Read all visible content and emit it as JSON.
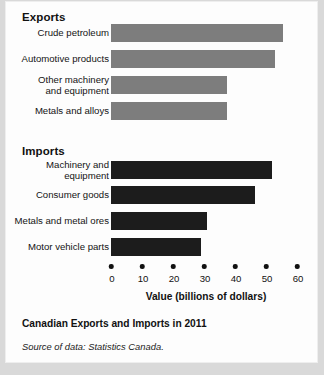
{
  "figure": {
    "caption_title": "Canadian Exports and Imports in 2011",
    "source_note": "Source of data: Statistics Canada."
  },
  "sections": {
    "exports_heading": "Exports",
    "imports_heading": "Imports"
  },
  "colors": {
    "export_bar": "#7d7d7d",
    "import_bar": "#1c1c1c",
    "background": "#fdfdfd",
    "text": "#111111"
  },
  "chart_data": {
    "type": "bar",
    "orientation": "horizontal",
    "title": "Canadian Exports and Imports in 2011",
    "subtitle": "",
    "xlabel": "Value (billions of dollars)",
    "ylabel": "",
    "xlim": [
      0,
      60
    ],
    "xticks": [
      0,
      10,
      20,
      30,
      40,
      50,
      60
    ],
    "xticklabels": [
      "0",
      "10",
      "20",
      "30",
      "40",
      "50",
      "60"
    ],
    "grid": false,
    "legend": "none",
    "groups": [
      {
        "name": "Exports",
        "color": "#7d7d7d",
        "categories": [
          "Crude petroleum",
          "Automotive products",
          "Other machinery\nand equipment",
          "Metals and alloys"
        ],
        "values": [
          55.5,
          53.0,
          37.5,
          37.5
        ]
      },
      {
        "name": "Imports",
        "color": "#1c1c1c",
        "categories": [
          "Machinery and\nequipment",
          "Consumer goods",
          "Metals and metal ores",
          "Motor vehicle parts"
        ],
        "values": [
          52.0,
          46.5,
          31.0,
          29.0
        ]
      }
    ],
    "annotations": [
      "Source of data: Statistics Canada."
    ]
  }
}
